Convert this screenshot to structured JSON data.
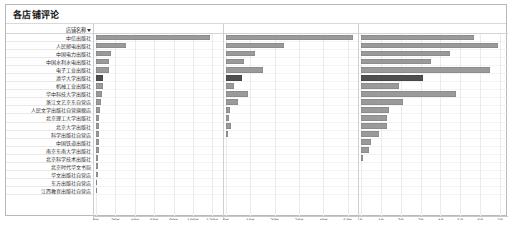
{
  "window": {
    "title": "各店铺评论"
  },
  "table": {
    "row_header_label": "店铺名称",
    "sort_icon": "sort-descending-arrow-icon"
  },
  "colors": {
    "bar_default": "#9a9a9a",
    "bar_highlight": "#4f4f4f",
    "grid": "#ebebeb",
    "frame_border": "#b9b9b9",
    "text": "#222222"
  },
  "chart_data": {
    "type": "bar",
    "title": "各店铺评论",
    "orientation": "horizontal",
    "grid": true,
    "legend": "none",
    "categories": [
      "中信出版社",
      "人民邮电出版社",
      "中国电力出版社",
      "中国水利水电出版社",
      "电子工业出版社",
      "清华大学出版社",
      "机械工业出版社",
      "华中科技大学出版社",
      "浙江文艺京东自营店",
      "人民文学出版社自营旗舰店",
      "北京理工大学出版社",
      "北京大学出版社",
      "科学出版社自营店",
      "中国铁道出版社",
      "南京东南大学出版社",
      "北京科学技术出版社",
      "北京时代华文书局",
      "华文出版社自营店",
      "东方出版社自营店",
      "江西教育出版社自营店"
    ],
    "panels": [
      {
        "name": "评论数量",
        "xlabel": "千店的 评论数量",
        "xlim": [
          0,
          128000
        ],
        "tick_values": [
          0,
          20000,
          40000,
          60000,
          80000,
          100000,
          120000
        ],
        "tick_labels": [
          "0K",
          "20K",
          "40K",
          "60K",
          "80K",
          "100K",
          "120K"
        ],
        "values": [
          118000,
          30500,
          15200,
          13800,
          13200,
          7400,
          7100,
          6200,
          5600,
          4200,
          3600,
          3300,
          3100,
          2900,
          2600,
          2300,
          2000,
          1700,
          1400,
          1100
        ]
      },
      {
        "name": "好评数",
        "xlabel": "千店的 好评数",
        "xlim": [
          0,
          53000
        ],
        "tick_values": [
          0,
          10000,
          20000,
          30000,
          40000,
          50000
        ],
        "tick_labels": [
          "0K",
          "10K",
          "20K",
          "30K",
          "40K",
          "50K"
        ],
        "values": [
          52000,
          24000,
          12000,
          7200,
          15200,
          6500,
          3400,
          9200,
          4900,
          1500,
          1200,
          2000,
          700,
          0,
          0,
          0,
          0,
          0,
          0,
          0
        ]
      },
      {
        "name": "差评数",
        "xlabel": "千店的 差评数",
        "xlim": [
          0,
          72
        ],
        "tick_values": [
          0,
          10,
          20,
          30,
          40,
          50,
          60,
          70
        ],
        "tick_labels": [
          "0",
          "10",
          "20",
          "30",
          "40",
          "50",
          "60",
          "70"
        ],
        "values": [
          57,
          69,
          45,
          35,
          65,
          31,
          19,
          48,
          21,
          14,
          13,
          13,
          9,
          5,
          4,
          1,
          0,
          0,
          0,
          0
        ]
      }
    ],
    "highlight_row_index": 5
  }
}
